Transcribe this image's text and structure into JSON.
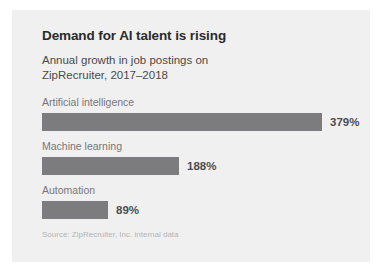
{
  "chart_data": {
    "type": "bar",
    "orientation": "horizontal",
    "title": "Demand for AI talent is rising",
    "subtitle": "Annual growth in job postings on ZipRecruiter, 2017–2018",
    "source": "Source: ZipRecruiter, Inc. internal data",
    "categories": [
      "Artificial intelligence",
      "Machine learning",
      "Automation"
    ],
    "values": [
      379,
      188,
      89
    ],
    "value_labels": [
      "379%",
      "188%",
      "89%"
    ],
    "unit": "%",
    "xlabel": "",
    "ylabel": "",
    "xlim": [
      0,
      379
    ],
    "grid": false,
    "legend": false,
    "bar_color": "#7c7c7e",
    "background_color": "#f0f0f0",
    "title_color": "#2b2b2b",
    "label_color": "#77777a",
    "value_color": "#4d4d4f",
    "source_color": "#b4b4b6",
    "bars": [
      {
        "category": "Artificial intelligence",
        "value": 379,
        "label": "379%",
        "bar_px": 280
      },
      {
        "category": "Machine learning",
        "value": 188,
        "label": "188%",
        "bar_px": 137
      },
      {
        "category": "Automation",
        "value": 89,
        "label": "89%",
        "bar_px": 66
      }
    ]
  }
}
